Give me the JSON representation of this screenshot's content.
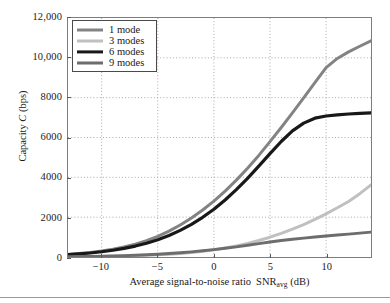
{
  "chart_data": {
    "type": "line",
    "title": "",
    "xlabel": "Average signal-to-noise ratio  SNR_avg (dB)",
    "xlabel_main": "Average signal-to-noise ratio",
    "xlabel_symbol": "SNR",
    "xlabel_subscript": "avg",
    "xlabel_unit": "(dB)",
    "ylabel": "Capacity C (bps)",
    "ylabel_prefix": "Capacity ",
    "ylabel_symbol": "C",
    "ylabel_unit": " (bps)",
    "xlim": [
      -13,
      14
    ],
    "ylim": [
      0,
      12000
    ],
    "grid": true,
    "grid_style": "dotted",
    "legend_position": "top-left",
    "xticks": [
      -10,
      -5,
      0,
      5,
      10
    ],
    "xtick_labels": [
      "−10",
      "−5",
      "0",
      "5",
      "10"
    ],
    "yticks": [
      0,
      2000,
      4000,
      6000,
      8000,
      10000,
      12000
    ],
    "ytick_labels": [
      "0",
      "2000",
      "4000",
      "6000",
      "8000",
      "10,000",
      "12,000"
    ],
    "x": [
      -13,
      -12,
      -11,
      -10,
      -9,
      -8,
      -7,
      -6,
      -5,
      -4,
      -3,
      -2,
      -1,
      0,
      1,
      2,
      3,
      4,
      5,
      6,
      7,
      8,
      9,
      10,
      11,
      12,
      13,
      14
    ],
    "series": [
      {
        "name": "1 mode",
        "color": "#838383",
        "width": 3.0,
        "values": [
          130,
          175,
          230,
          300,
          390,
          500,
          640,
          820,
          1040,
          1300,
          1610,
          1960,
          2360,
          2810,
          3310,
          3860,
          4460,
          5100,
          5790,
          6500,
          7240,
          7990,
          8750,
          9510,
          9970,
          10300,
          10580,
          10850
        ]
      },
      {
        "name": "3 modes",
        "color": "#c0c0c0",
        "width": 3.0,
        "values": [
          10,
          14,
          19,
          26,
          35,
          47,
          62,
          82,
          107,
          139,
          179,
          228,
          289,
          363,
          452,
          558,
          683,
          828,
          994,
          1183,
          1395,
          1630,
          1888,
          2168,
          2470,
          2790,
          3180,
          3620
        ]
      },
      {
        "name": "6 modes",
        "color": "#181818",
        "width": 3.2,
        "values": [
          118,
          155,
          202,
          262,
          338,
          432,
          548,
          692,
          868,
          1082,
          1338,
          1640,
          1993,
          2400,
          2862,
          3380,
          3950,
          4560,
          5190,
          5800,
          6330,
          6720,
          6970,
          7080,
          7140,
          7180,
          7210,
          7240
        ]
      },
      {
        "name": "9 modes",
        "color": "#6d6d6d",
        "width": 3.0,
        "values": [
          18,
          24,
          31,
          41,
          53,
          68,
          87,
          110,
          138,
          172,
          212,
          258,
          311,
          370,
          436,
          508,
          586,
          670,
          758,
          830,
          892,
          948,
          1000,
          1050,
          1100,
          1148,
          1198,
          1250
        ]
      }
    ]
  },
  "legend": {
    "entries": [
      {
        "label": "1 mode",
        "color": "#838383"
      },
      {
        "label": "3 modes",
        "color": "#c0c0c0"
      },
      {
        "label": "6 modes",
        "color": "#181818"
      },
      {
        "label": "9 modes",
        "color": "#6d6d6d"
      }
    ]
  },
  "axes": {
    "grid_color": "#9e9e9e",
    "frame_color": "#7d7d7d"
  }
}
